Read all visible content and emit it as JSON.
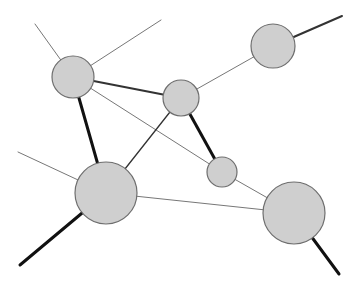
{
  "diagram": {
    "type": "network-graph",
    "width": 358,
    "height": 289,
    "colors": {
      "background": "#ffffff",
      "node_fill": "#cfcfcf",
      "node_stroke": "#6e6e6e",
      "edge_thin": "#777777",
      "edge_medium": "#333333",
      "edge_thick": "#111111"
    },
    "nodes": [
      {
        "id": "A",
        "cx": 73,
        "cy": 77,
        "r": 21
      },
      {
        "id": "B",
        "cx": 181,
        "cy": 98,
        "r": 18
      },
      {
        "id": "C",
        "cx": 273,
        "cy": 46,
        "r": 22
      },
      {
        "id": "D",
        "cx": 222,
        "cy": 172,
        "r": 15
      },
      {
        "id": "E",
        "cx": 106,
        "cy": 193,
        "r": 31
      },
      {
        "id": "F",
        "cx": 294,
        "cy": 213,
        "r": 31
      }
    ],
    "edges": [
      {
        "from": "A",
        "to": "B",
        "weight": "medium"
      },
      {
        "from": "A",
        "to": "D",
        "weight": "thin"
      },
      {
        "from": "A",
        "to": "E",
        "weight": "thick"
      },
      {
        "from": "B",
        "to": "C",
        "weight": "thin"
      },
      {
        "from": "B",
        "to": "D",
        "weight": "thick"
      },
      {
        "from": "B",
        "to": "E",
        "weight": "thin-medium"
      },
      {
        "from": "E",
        "to": "F",
        "weight": "thin"
      },
      {
        "from": "D",
        "to": "F",
        "weight": "thin"
      }
    ],
    "dangling_edges": [
      {
        "from": "A",
        "x": 35,
        "y": 24,
        "weight": "thin"
      },
      {
        "from": "A",
        "x": 161,
        "y": 20,
        "weight": "thin"
      },
      {
        "from": "C",
        "x": 342,
        "y": 16,
        "weight": "medium"
      },
      {
        "from": "E",
        "x": 18,
        "y": 152,
        "weight": "thin"
      },
      {
        "from": "E",
        "x": 20,
        "y": 265,
        "weight": "thick"
      },
      {
        "from": "F",
        "x": 339,
        "y": 274,
        "weight": "thick"
      }
    ]
  }
}
